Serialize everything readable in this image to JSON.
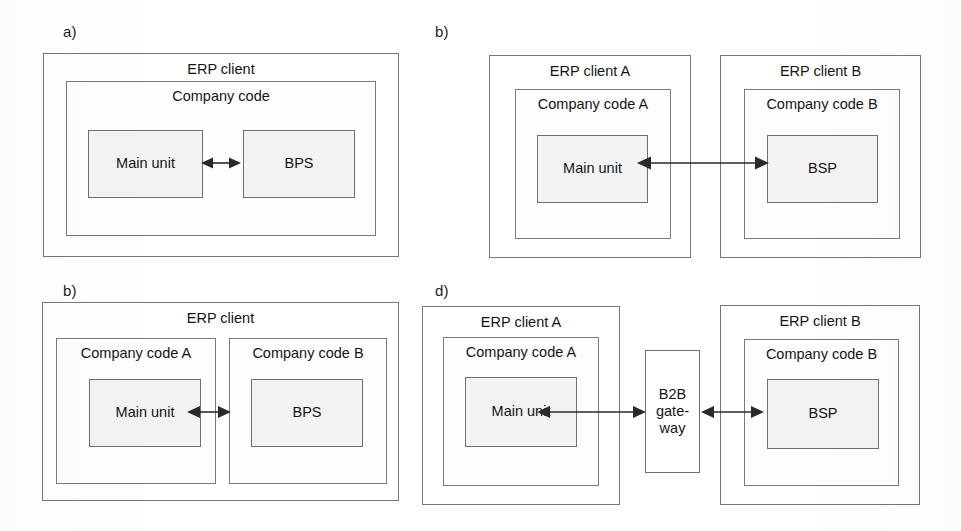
{
  "figure": {
    "background_color": "#ffffff",
    "line_color": "#6f6f6f",
    "leaf_fill_color": "#f3f3f3",
    "arrow_color": "#2a2a2a"
  },
  "panels": [
    {
      "id": "panel-a",
      "label": "a)",
      "containers": [
        {
          "id": "erp-client",
          "title": "ERP client",
          "children": [
            {
              "id": "company-code",
              "title": "Company code",
              "children": [
                {
                  "id": "main-unit",
                  "label": "Main unit"
                },
                {
                  "id": "bps",
                  "label": "BPS"
                }
              ]
            }
          ]
        }
      ],
      "connections": [
        {
          "id": "main-unit-to-bps",
          "from": "main-unit",
          "to": "bps",
          "type": "bidirectional"
        }
      ]
    },
    {
      "id": "panel-b-top",
      "label": "b)",
      "containers": [
        {
          "id": "erp-client-a",
          "title": "ERP client A",
          "children": [
            {
              "id": "company-code-a",
              "title": "Company code A",
              "children": [
                {
                  "id": "main-unit",
                  "label": "Main unit"
                }
              ]
            }
          ]
        },
        {
          "id": "erp-client-b",
          "title": "ERP client B",
          "children": [
            {
              "id": "company-code-b",
              "title": "Company code B",
              "children": [
                {
                  "id": "bsp",
                  "label": "BSP"
                }
              ]
            }
          ]
        }
      ],
      "connections": [
        {
          "id": "main-unit-to-bsp",
          "from": "main-unit",
          "to": "bsp",
          "type": "bidirectional"
        }
      ]
    },
    {
      "id": "panel-b-bottom",
      "label": "b)",
      "containers": [
        {
          "id": "erp-client",
          "title": "ERP client",
          "children": [
            {
              "id": "company-code-a",
              "title": "Company code A",
              "children": [
                {
                  "id": "main-unit",
                  "label": "Main unit"
                }
              ]
            },
            {
              "id": "company-code-b",
              "title": "Company code B",
              "children": [
                {
                  "id": "bps",
                  "label": "BPS"
                }
              ]
            }
          ]
        }
      ],
      "connections": [
        {
          "id": "main-unit-to-bps",
          "from": "main-unit",
          "to": "bps",
          "type": "bidirectional"
        }
      ]
    },
    {
      "id": "panel-d",
      "label": "d)",
      "containers": [
        {
          "id": "erp-client-a",
          "title": "ERP client A",
          "children": [
            {
              "id": "company-code-a",
              "title": "Company code A",
              "children": [
                {
                  "id": "main-unit",
                  "label": "Main unit"
                }
              ]
            }
          ]
        },
        {
          "id": "b2b-gateway",
          "label": "B2B\ngate-\nway"
        },
        {
          "id": "erp-client-b",
          "title": "ERP client B",
          "children": [
            {
              "id": "company-code-b",
              "title": "Company code B",
              "children": [
                {
                  "id": "bsp",
                  "label": "BSP"
                }
              ]
            }
          ]
        }
      ],
      "connections": [
        {
          "id": "main-unit-to-gateway",
          "from": "main-unit",
          "to": "b2b-gateway",
          "type": "bidirectional"
        },
        {
          "id": "gateway-to-bsp",
          "from": "b2b-gateway",
          "to": "bsp",
          "type": "bidirectional"
        }
      ]
    }
  ]
}
